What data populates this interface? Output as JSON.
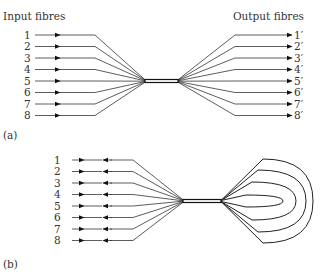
{
  "diagram": {
    "panel_a": {
      "caption": "(a)",
      "input_title": "Input fibres",
      "output_title": "Output fibres",
      "inputs": [
        "1",
        "2",
        "3",
        "4",
        "5",
        "6",
        "7",
        "8"
      ],
      "outputs": [
        "1′",
        "2′",
        "3′",
        "4′",
        "5′",
        "6′",
        "7′",
        "8′"
      ]
    },
    "panel_b": {
      "caption": "(b)",
      "ports": [
        "1",
        "2",
        "3",
        "4",
        "5",
        "6",
        "7",
        "8"
      ],
      "loop_count": 4
    }
  }
}
